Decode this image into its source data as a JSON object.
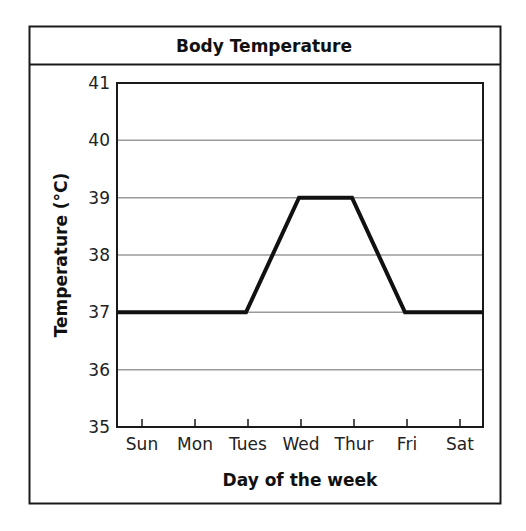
{
  "chart_data": {
    "type": "line",
    "title": "Body Temperature",
    "xlabel": "Day of the week",
    "ylabel": "Temperature (°C)",
    "categories": [
      "Sun",
      "Mon",
      "Tues",
      "Wed",
      "Thur",
      "Fri",
      "Sat"
    ],
    "series": [
      {
        "name": "Body Temperature",
        "values": [
          37,
          37,
          37,
          39,
          39,
          37,
          37
        ]
      }
    ],
    "yticks": [
      35,
      36,
      37,
      38,
      39,
      40,
      41
    ],
    "ylim": [
      35,
      41
    ],
    "grid": true,
    "legend": null
  },
  "colors": {
    "line": "#111111",
    "grid": "#9a9a9a",
    "frame": "#1a1a1a"
  }
}
